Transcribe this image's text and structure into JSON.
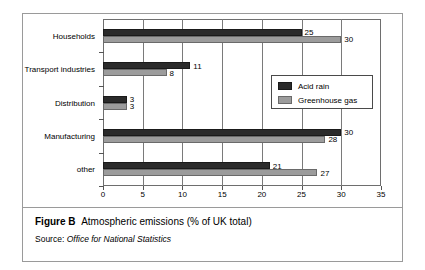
{
  "figure": {
    "caption_figno": "Figure B",
    "caption_text": "Atmospheric emissions (% of UK total)",
    "source_prefix": "Source:",
    "source_name": "Office for National Statistics"
  },
  "legend": {
    "position": "inside-right",
    "items": [
      {
        "label": "Acid rain",
        "color": "#2b2b2b"
      },
      {
        "label": "Greenhouse gas",
        "color": "#9c9c9c"
      }
    ]
  },
  "chart_data": {
    "type": "bar",
    "orientation": "horizontal",
    "title": "Atmospheric emissions (% of UK total)",
    "xlabel": "",
    "ylabel": "",
    "xlim": [
      0,
      35
    ],
    "xticks": [
      0,
      5,
      10,
      15,
      20,
      25,
      30,
      35
    ],
    "xtick_labels": [
      "0",
      "5",
      "10",
      "15",
      "20",
      "25",
      "30",
      "35"
    ],
    "grid": true,
    "grid_axis": "x",
    "categories": [
      "Households",
      "Transport industries",
      "Distribution",
      "Manufacturing",
      "other"
    ],
    "series": [
      {
        "name": "Acid rain",
        "color": "#2b2b2b",
        "values": [
          25,
          11,
          3,
          30,
          21
        ]
      },
      {
        "name": "Greenhouse gas",
        "color": "#9c9c9c",
        "values": [
          30,
          8,
          3,
          28,
          27
        ]
      }
    ],
    "data_labels": {
      "Acid rain": [
        "25",
        "11",
        "3",
        "30",
        "21"
      ],
      "Greenhouse gas": [
        "30",
        "8",
        "3",
        "28",
        "27"
      ]
    }
  }
}
